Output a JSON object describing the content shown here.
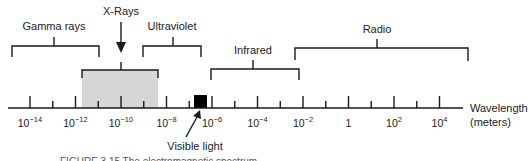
{
  "diagram": {
    "axis": {
      "label_line1": "Wavelength",
      "label_line2": "(meters)",
      "major_ticks": [
        {
          "base": "10",
          "exp": "−14"
        },
        {
          "base": "10",
          "exp": "−12"
        },
        {
          "base": "10",
          "exp": "−10"
        },
        {
          "base": "10",
          "exp": "−8"
        },
        {
          "base": "10",
          "exp": "−6"
        },
        {
          "base": "10",
          "exp": "−4"
        },
        {
          "base": "10",
          "exp": "−2"
        },
        {
          "base": "1",
          "exp": ""
        },
        {
          "base": "10",
          "exp": "2"
        },
        {
          "base": "10",
          "exp": "4"
        }
      ]
    },
    "bands": {
      "gamma": "Gamma rays",
      "xrays": "X-Rays",
      "ultraviolet": "Ultraviolet",
      "visible": "Visible light",
      "infrared": "Infrared",
      "radio": "Radio"
    },
    "colors": {
      "xray_fill": "#d6d6d6",
      "visible_fill": "#000000",
      "line": "#1a1a1a"
    },
    "caption": "FIGURE 3.15  The electromagnetic spectrum"
  }
}
